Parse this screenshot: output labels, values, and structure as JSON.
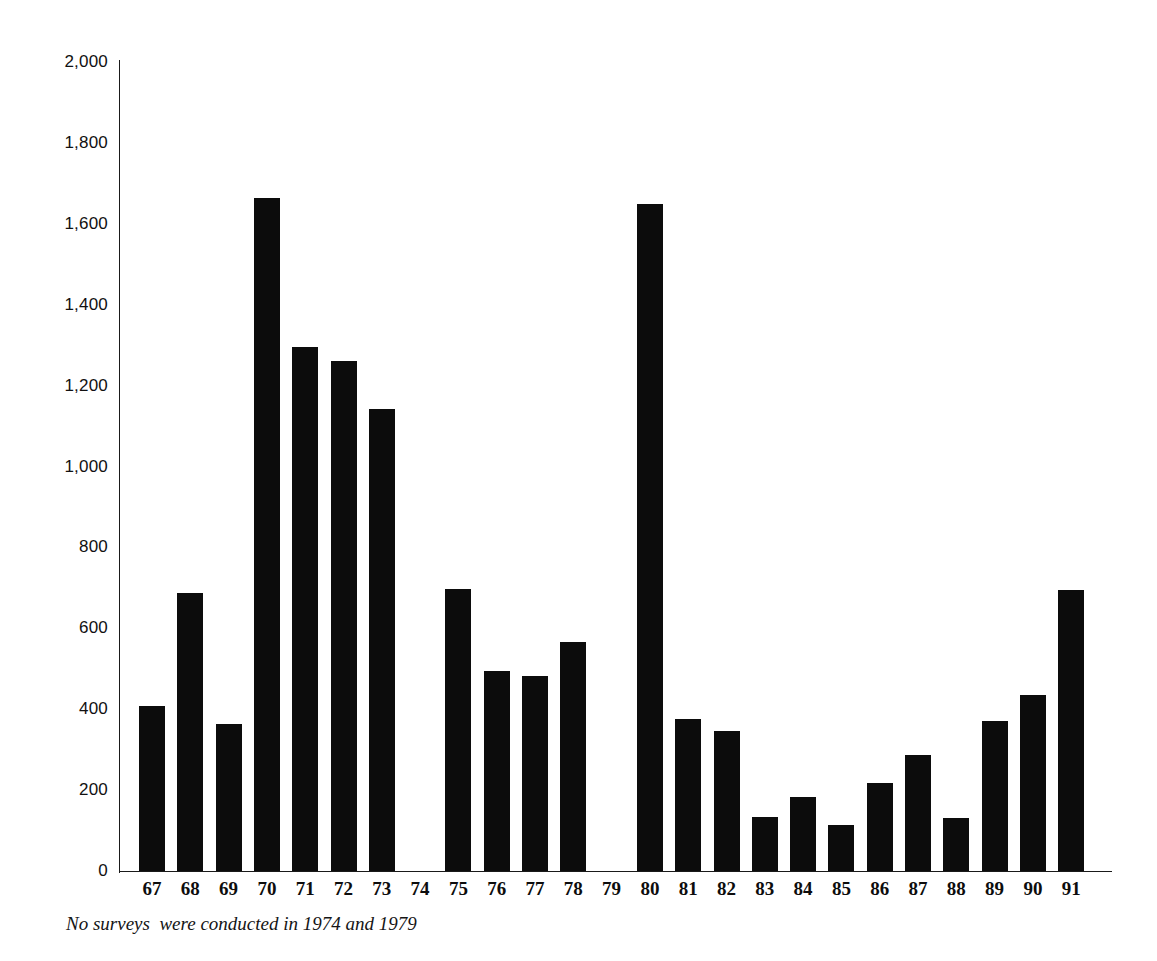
{
  "chart_data": {
    "type": "bar",
    "title": "",
    "subtitle": "",
    "xlabel": "",
    "ylabel": "",
    "ylim": [
      0,
      2000
    ],
    "xlim_categories_note": "Years 1967-1991 shown as two-digit labels",
    "grid": false,
    "legend": null,
    "bar_color": "#0c0c0c",
    "y_ticks": [
      "0",
      "200",
      "400",
      "600",
      "800",
      "1,000",
      "1,200",
      "1,400",
      "1,600",
      "1,800",
      "2,000"
    ],
    "y_tick_values": [
      0,
      200,
      400,
      600,
      800,
      1000,
      1200,
      1400,
      1600,
      1800,
      2000
    ],
    "categories": [
      "67",
      "68",
      "69",
      "70",
      "71",
      "72",
      "73",
      "74",
      "75",
      "76",
      "77",
      "78",
      "79",
      "80",
      "81",
      "82",
      "83",
      "84",
      "85",
      "86",
      "87",
      "88",
      "89",
      "90",
      "91"
    ],
    "values": [
      408,
      688,
      364,
      1665,
      1295,
      1260,
      1143,
      null,
      697,
      495,
      483,
      567,
      null,
      1648,
      376,
      347,
      134,
      183,
      113,
      217,
      287,
      132,
      371,
      434,
      695
    ],
    "missing_categories": [
      "74",
      "79"
    ],
    "annotations": [
      {
        "name": "footnote",
        "text": "No surveys  were conducted in 1974 and 1979"
      }
    ]
  },
  "footnote": {
    "text": "No surveys  were conducted in 1974 and 1979"
  }
}
